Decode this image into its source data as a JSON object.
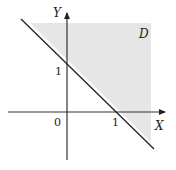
{
  "diagram": {
    "region_label": "D",
    "x_axis_label": "X",
    "y_axis_label": "Y",
    "origin_label": "0",
    "x_tick_label": "1",
    "y_tick_label": "1",
    "line_equation": "x + y = 1",
    "region_description": "x + y >= 1 (shaded)",
    "colors": {
      "shade": "#e6e6e6",
      "line": "#222222",
      "axis": "#333333"
    }
  }
}
